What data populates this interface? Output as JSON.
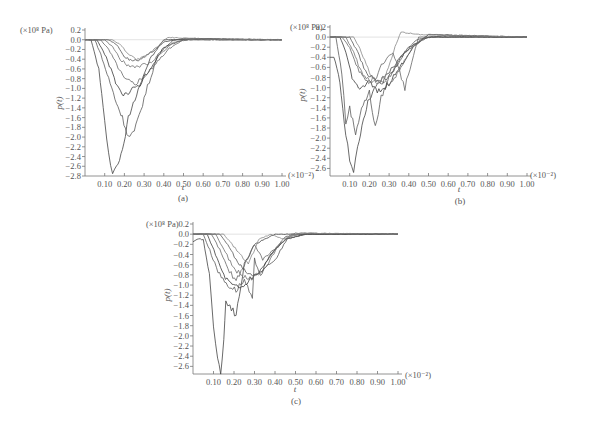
{
  "chart_data": [
    {
      "id": "a",
      "type": "line",
      "caption": "(a)",
      "xlabel": "t",
      "ylabel": "p(t)",
      "y_unit": "(×10⁸ Pa)",
      "x_unit": "(×10⁻²)",
      "xlim": [
        0,
        1.0
      ],
      "ylim": [
        -2.8,
        0.2
      ],
      "xticks": [
        "0.10",
        "0.20",
        "0.30",
        "0.40",
        "0.50",
        "0.60",
        "0.70",
        "0.80",
        "0.90",
        "1.00"
      ],
      "yticks": [
        "0.2",
        "0.0",
        "-0.2",
        "-0.4",
        "-0.6",
        "-0.8",
        "-1.0",
        "-1.2",
        "-1.4",
        "-1.6",
        "-1.8",
        "-2.0",
        "-2.2",
        "-2.4",
        "-2.6",
        "-2.8"
      ],
      "grid": false,
      "series": [
        {
          "name": "s1",
          "x": [
            0,
            0.03,
            0.07,
            0.1,
            0.12,
            0.14,
            0.16,
            0.19,
            0.22,
            0.27,
            0.33,
            0.4,
            0.5,
            0.6,
            0.8,
            1.0
          ],
          "y": [
            0,
            0,
            -0.6,
            -1.7,
            -2.3,
            -2.75,
            -2.6,
            -2.3,
            -1.6,
            -1.0,
            -0.4,
            0,
            0,
            0.02,
            0,
            0
          ]
        },
        {
          "name": "s2",
          "x": [
            0,
            0.05,
            0.08,
            0.12,
            0.16,
            0.19,
            0.22,
            0.25,
            0.3,
            0.37,
            0.45,
            0.55,
            0.7,
            1.0
          ],
          "y": [
            0,
            0,
            -0.3,
            -0.8,
            -1.3,
            -1.6,
            -2.0,
            -1.9,
            -1.2,
            -0.3,
            0,
            0.02,
            0,
            0
          ]
        },
        {
          "name": "s3",
          "x": [
            0,
            0.06,
            0.1,
            0.14,
            0.18,
            0.21,
            0.24,
            0.28,
            0.33,
            0.4,
            0.5,
            0.7,
            1.0
          ],
          "y": [
            0,
            0,
            -0.3,
            -0.7,
            -1.1,
            -1.15,
            -1.0,
            -0.9,
            -0.6,
            -0.15,
            0,
            0,
            0
          ]
        },
        {
          "name": "s4",
          "x": [
            0,
            0.08,
            0.12,
            0.16,
            0.2,
            0.25,
            0.3,
            0.36,
            0.42,
            0.5,
            0.7,
            1.0
          ],
          "y": [
            0,
            0,
            -0.2,
            -0.5,
            -0.8,
            -0.9,
            -0.75,
            -0.5,
            -0.2,
            0,
            0,
            0
          ]
        },
        {
          "name": "s5",
          "x": [
            0,
            0.1,
            0.14,
            0.18,
            0.22,
            0.27,
            0.32,
            0.38,
            0.45,
            0.55,
            1.0
          ],
          "y": [
            0,
            0,
            -0.15,
            -0.4,
            -0.55,
            -0.55,
            -0.5,
            -0.3,
            -0.05,
            0.02,
            0
          ]
        },
        {
          "name": "s6",
          "x": [
            0,
            0.12,
            0.16,
            0.2,
            0.24,
            0.28,
            0.34,
            0.4,
            0.5,
            1.0
          ],
          "y": [
            0,
            0,
            -0.1,
            -0.35,
            -0.45,
            -0.4,
            -0.25,
            -0.05,
            0.03,
            0
          ]
        },
        {
          "name": "s7",
          "x": [
            0,
            0.14,
            0.18,
            0.22,
            0.26,
            0.3,
            0.35,
            0.42,
            0.55,
            1.0
          ],
          "y": [
            0,
            0,
            -0.1,
            -0.3,
            -0.4,
            -0.35,
            -0.2,
            0.05,
            0.02,
            0
          ]
        }
      ]
    },
    {
      "id": "b",
      "type": "line",
      "caption": "(b)",
      "xlabel": "t",
      "ylabel": "p(t)",
      "y_unit": "(×10⁸ Pa)",
      "x_unit": "(×10⁻²)",
      "xlim": [
        0,
        1.0
      ],
      "ylim": [
        -2.75,
        0.2
      ],
      "xticks": [
        "0.10",
        "0.20",
        "0.30",
        "0.40",
        "0.50",
        "0.60",
        "0.70",
        "0.80",
        "0.90",
        "1.00"
      ],
      "yticks": [
        "0.2",
        "0.0",
        "-0.2",
        "-0.4",
        "-0.6",
        "-0.8",
        "-1.0",
        "-1.2",
        "-1.4",
        "-1.6",
        "-1.8",
        "-2.0",
        "-2.2",
        "-2.4",
        "-2.6"
      ],
      "grid": false,
      "series": [
        {
          "name": "s1",
          "x": [
            0,
            0.02,
            0.05,
            0.08,
            0.1,
            0.12,
            0.14,
            0.17,
            0.2,
            0.25,
            0.32,
            0.4,
            0.5,
            1.0
          ],
          "y": [
            -0.4,
            -0.4,
            -0.9,
            -1.9,
            -2.4,
            -2.7,
            -2.2,
            -1.6,
            -1.2,
            -0.9,
            -0.6,
            -0.2,
            0,
            0
          ]
        },
        {
          "name": "s2",
          "x": [
            0,
            0.03,
            0.06,
            0.08,
            0.1,
            0.13,
            0.16,
            0.2,
            0.23,
            0.26,
            0.3,
            0.38,
            0.48,
            1.0
          ],
          "y": [
            0,
            0,
            -0.7,
            -1.7,
            -1.4,
            -1.9,
            -1.4,
            -1.1,
            -1.8,
            -1.2,
            -0.8,
            -0.3,
            0,
            0
          ]
        },
        {
          "name": "s3",
          "x": [
            0,
            0.05,
            0.08,
            0.12,
            0.16,
            0.2,
            0.24,
            0.28,
            0.34,
            0.42,
            0.5,
            1.0
          ],
          "y": [
            0,
            0,
            -0.3,
            -0.9,
            -1.0,
            -0.9,
            -1.1,
            -1.0,
            -0.7,
            -0.2,
            0.05,
            0
          ]
        },
        {
          "name": "s4",
          "x": [
            0,
            0.06,
            0.1,
            0.14,
            0.18,
            0.22,
            0.27,
            0.32,
            0.38,
            0.45,
            1.0
          ],
          "y": [
            0,
            0,
            -0.2,
            -0.6,
            -0.9,
            -0.9,
            -0.5,
            -0.3,
            -1.0,
            0,
            0
          ]
        },
        {
          "name": "s5",
          "x": [
            0,
            0.08,
            0.12,
            0.16,
            0.2,
            0.24,
            0.3,
            0.36,
            0.42,
            0.5,
            1.0
          ],
          "y": [
            0,
            0,
            -0.3,
            -0.7,
            -0.85,
            -0.85,
            -0.95,
            -0.6,
            -0.2,
            0.05,
            0
          ]
        },
        {
          "name": "s6",
          "x": [
            0,
            0.1,
            0.14,
            0.18,
            0.22,
            0.26,
            0.3,
            0.36,
            0.44,
            0.55,
            1.0
          ],
          "y": [
            0,
            0,
            -0.3,
            -0.7,
            -0.8,
            -0.9,
            -0.8,
            -0.4,
            -0.05,
            0.02,
            0
          ]
        },
        {
          "name": "s7",
          "x": [
            0,
            0.12,
            0.16,
            0.2,
            0.24,
            0.28,
            0.33,
            0.36,
            0.45,
            1.0
          ],
          "y": [
            0,
            0,
            -0.3,
            -0.7,
            -0.9,
            -0.8,
            -0.2,
            0.1,
            0.05,
            0
          ]
        }
      ]
    },
    {
      "id": "c",
      "type": "line",
      "caption": "(c)",
      "xlabel": "t",
      "ylabel": "p(t)",
      "y_unit": "(×10⁸ Pa)",
      "x_unit": "(×10⁻²)",
      "xlim": [
        0,
        1.0
      ],
      "ylim": [
        -2.75,
        0.2
      ],
      "xticks": [
        "0.10",
        "0.20",
        "0.30",
        "0.40",
        "0.50",
        "0.60",
        "0.70",
        "0.80",
        "0.90",
        "1.00"
      ],
      "yticks": [
        "0.2",
        "0.0",
        "-0.2",
        "-0.4",
        "-0.6",
        "-0.8",
        "-1.0",
        "-1.2",
        "-1.4",
        "-1.6",
        "-1.8",
        "-2.0",
        "-2.2",
        "-2.4",
        "-2.6"
      ],
      "grid": false,
      "series": [
        {
          "name": "s1",
          "x": [
            0,
            0.02,
            0.05,
            0.08,
            0.1,
            0.12,
            0.135,
            0.15,
            0.16,
            0.18,
            0.21,
            0.25,
            0.3,
            0.4,
            0.5,
            1.0
          ],
          "y": [
            -0.15,
            -0.1,
            -0.1,
            -0.8,
            -1.8,
            -2.4,
            -2.75,
            -2.1,
            -1.3,
            -1.4,
            -1.6,
            -0.6,
            -0.2,
            0,
            0,
            0
          ]
        },
        {
          "name": "s2",
          "x": [
            0,
            0.05,
            0.09,
            0.13,
            0.17,
            0.21,
            0.25,
            0.29,
            0.3,
            0.33,
            0.38,
            0.45,
            0.55,
            1.0
          ],
          "y": [
            0,
            0,
            -0.4,
            -0.8,
            -1.0,
            -1.1,
            -0.9,
            -1.3,
            -0.5,
            -0.8,
            -0.4,
            -0.05,
            0,
            0
          ]
        },
        {
          "name": "s3",
          "x": [
            0,
            0.07,
            0.11,
            0.15,
            0.19,
            0.23,
            0.28,
            0.33,
            0.38,
            0.45,
            0.55,
            1.0
          ],
          "y": [
            0,
            0,
            -0.4,
            -0.8,
            -1.0,
            -1.05,
            -0.9,
            -0.7,
            -0.4,
            -0.1,
            0,
            0
          ]
        },
        {
          "name": "s4",
          "x": [
            0,
            0.09,
            0.13,
            0.17,
            0.21,
            0.25,
            0.3,
            0.34,
            0.4,
            0.48,
            1.0
          ],
          "y": [
            0,
            0,
            -0.3,
            -0.7,
            -0.9,
            -0.6,
            -0.2,
            -0.5,
            -0.3,
            0,
            0
          ]
        },
        {
          "name": "s5",
          "x": [
            0,
            0.11,
            0.15,
            0.19,
            0.23,
            0.27,
            0.31,
            0.36,
            0.42,
            0.5,
            1.0
          ],
          "y": [
            0,
            0,
            -0.3,
            -0.6,
            -0.8,
            -0.9,
            -0.8,
            -0.6,
            -0.2,
            0.02,
            0
          ]
        },
        {
          "name": "s6",
          "x": [
            0,
            0.13,
            0.17,
            0.21,
            0.25,
            0.29,
            0.34,
            0.4,
            0.46,
            0.55,
            1.0
          ],
          "y": [
            0,
            0,
            -0.2,
            -0.5,
            -0.7,
            -0.8,
            -0.7,
            -0.5,
            -0.1,
            0,
            0
          ]
        },
        {
          "name": "s7",
          "x": [
            0,
            0.15,
            0.19,
            0.23,
            0.27,
            0.32,
            0.38,
            0.44,
            0.52,
            1.0
          ],
          "y": [
            0,
            0,
            -0.2,
            -0.4,
            -0.6,
            -0.1,
            0,
            -0.1,
            0.02,
            0
          ]
        }
      ]
    }
  ],
  "colors": {
    "axis": "#777777",
    "curves": [
      "#444444",
      "#5a5a5a",
      "#3a3a3a",
      "#666666",
      "#707070",
      "#555555",
      "#888888"
    ]
  }
}
